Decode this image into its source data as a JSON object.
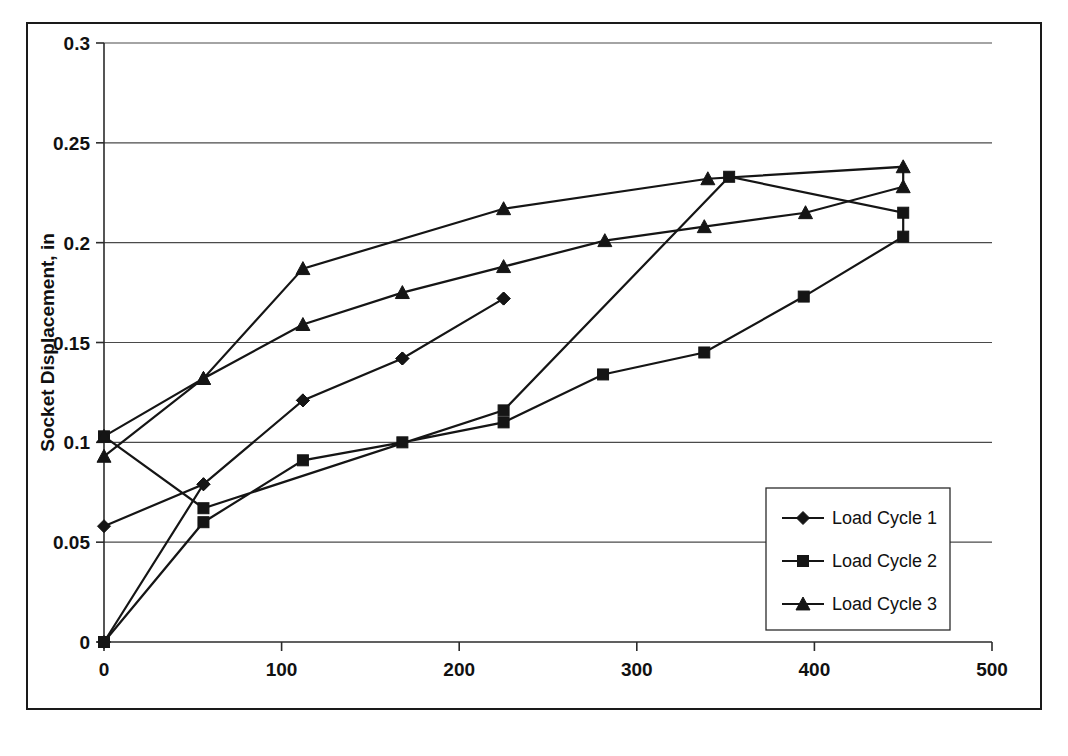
{
  "figure": {
    "border_color": "#1a1a1a",
    "background": "#ffffff"
  },
  "chart_data": {
    "type": "line",
    "title": "",
    "xlabel": "Tension Load, kips",
    "ylabel": "Socket Displacement, in",
    "xlim": [
      0,
      500
    ],
    "ylim": [
      0,
      0.3
    ],
    "xticks": [
      0,
      100,
      200,
      300,
      400,
      500
    ],
    "xtick_labels": [
      "0",
      "100",
      "200",
      "300",
      "400",
      "500"
    ],
    "yticks": [
      0,
      0.05,
      0.1,
      0.15,
      0.2,
      0.25,
      0.3
    ],
    "ytick_labels": [
      "0",
      "0.05",
      "0.1",
      "0.15",
      "0.2",
      "0.25",
      "0.3"
    ],
    "grid": "horizontal",
    "legend_position": "lower-right",
    "line_color": "#151515",
    "series": [
      {
        "name": "Load Cycle 1",
        "marker": "diamond",
        "points": [
          [
            0,
            0.0
          ],
          [
            56,
            0.079
          ],
          [
            112,
            0.121
          ],
          [
            168,
            0.142
          ],
          [
            225,
            0.172
          ],
          [
            225,
            0.172
          ],
          [
            168,
            0.142
          ],
          [
            112,
            0.121
          ],
          [
            56,
            0.079
          ],
          [
            0,
            0.058
          ]
        ]
      },
      {
        "name": "Load Cycle 2",
        "marker": "square",
        "points": [
          [
            0,
            0.0
          ],
          [
            56,
            0.06
          ],
          [
            112,
            0.091
          ],
          [
            168,
            0.1
          ],
          [
            225,
            0.11
          ],
          [
            281,
            0.134
          ],
          [
            338,
            0.145
          ],
          [
            394,
            0.173
          ],
          [
            450,
            0.203
          ],
          [
            450,
            0.215
          ],
          [
            352,
            0.233
          ],
          [
            225,
            0.116
          ],
          [
            56,
            0.067
          ],
          [
            0,
            0.103
          ]
        ]
      },
      {
        "name": "Load Cycle 3",
        "marker": "triangle",
        "points": [
          [
            0,
            0.093
          ],
          [
            56,
            0.132
          ],
          [
            112,
            0.159
          ],
          [
            168,
            0.175
          ],
          [
            225,
            0.188
          ],
          [
            282,
            0.201
          ],
          [
            338,
            0.208
          ],
          [
            395,
            0.215
          ],
          [
            450,
            0.228
          ],
          [
            450,
            0.238
          ],
          [
            340,
            0.232
          ],
          [
            225,
            0.217
          ],
          [
            112,
            0.187
          ],
          [
            56,
            0.132
          ],
          [
            0,
            0.103
          ]
        ]
      }
    ],
    "legend": [
      {
        "label": "Load Cycle 1",
        "marker": "diamond"
      },
      {
        "label": "Load Cycle 2",
        "marker": "square"
      },
      {
        "label": "Load Cycle 3",
        "marker": "triangle"
      }
    ]
  }
}
